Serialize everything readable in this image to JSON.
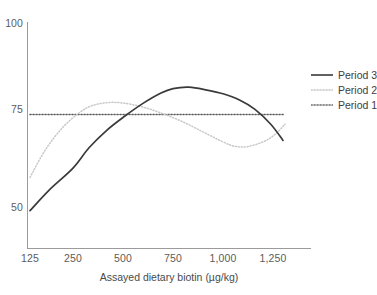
{
  "chart_data": {
    "type": "line",
    "title": "",
    "xlabel": "Assayed dietary biotin (µg/kg)",
    "ylabel": "",
    "xticklabels": [
      "125",
      "250",
      "500",
      "750",
      "1,000",
      "1,250"
    ],
    "xtickvalues": [
      125,
      250,
      500,
      750,
      1000,
      1250
    ],
    "yticklabels": [
      "50",
      "75",
      "100"
    ],
    "ytickvalues": [
      50,
      75,
      100
    ],
    "xlim": [
      125,
      1320
    ],
    "ylim": [
      40,
      100
    ],
    "grid": false,
    "legend_position": "right",
    "series": [
      {
        "name": "Period 3",
        "style": "solid",
        "color": "#3a3a3a",
        "x": [
          125,
          180,
          250,
          330,
          420,
          510,
          600,
          690,
          750,
          830,
          920,
          1000,
          1080,
          1160,
          1240,
          1300
        ],
        "y": [
          49.0,
          54.5,
          60.5,
          66.0,
          70.8,
          74.6,
          78.0,
          80.8,
          82.0,
          82.4,
          81.6,
          80.6,
          79.0,
          76.4,
          72.3,
          68.0
        ]
      },
      {
        "name": "Period 2",
        "style": "dotted",
        "color": "#c8c8c8",
        "x": [
          125,
          170,
          220,
          280,
          340,
          420,
          500,
          600,
          700,
          800,
          900,
          1000,
          1060,
          1120,
          1200,
          1260,
          1310
        ],
        "y": [
          58.0,
          65.5,
          71.5,
          75.4,
          77.3,
          78.2,
          78.1,
          77.0,
          75.2,
          73.0,
          70.3,
          67.6,
          66.4,
          66.3,
          67.6,
          69.6,
          72.4
        ]
      },
      {
        "name": "Period 1",
        "style": "dotted",
        "color": "#3a3a3a",
        "x": [
          125,
          1310
        ],
        "y": [
          75.0,
          75.0
        ]
      }
    ],
    "legend_entries": [
      {
        "label": "Period 3",
        "style": "solid",
        "color": "#3a3a3a"
      },
      {
        "label": "Period 2",
        "style": "dotted",
        "color": "#c8c8c8"
      },
      {
        "label": "Period 1",
        "style": "dotted",
        "color": "#3a3a3a"
      }
    ],
    "axis_color": "#9b9b9b"
  }
}
